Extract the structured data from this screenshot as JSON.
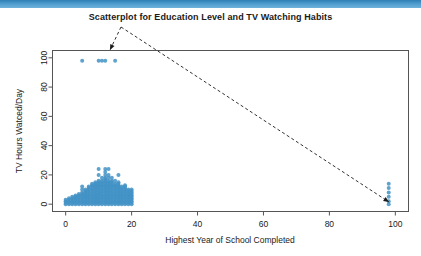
{
  "window": {
    "accent_color": "#3a8cc4"
  },
  "chart_data": {
    "type": "scatter",
    "title": "Scatterplot for Education Level and TV Watching Habits",
    "xlabel": "Highest Year of School Completed",
    "ylabel": "TV Hours Watced/Day",
    "xlim": [
      -4,
      104
    ],
    "ylim": [
      -5,
      105
    ],
    "xticks": [
      0,
      20,
      40,
      60,
      80,
      100
    ],
    "yticks": [
      0,
      20,
      40,
      60,
      80,
      100
    ],
    "grid": false,
    "legend": null,
    "point_color": "#4292c6",
    "point_size": 2,
    "series": [
      {
        "name": "Respondents",
        "points": [
          [
            0,
            0
          ],
          [
            0,
            1
          ],
          [
            0,
            2
          ],
          [
            0,
            3
          ],
          [
            1,
            0
          ],
          [
            1,
            1
          ],
          [
            1,
            2
          ],
          [
            1,
            3
          ],
          [
            1,
            4
          ],
          [
            2,
            0
          ],
          [
            2,
            1
          ],
          [
            2,
            2
          ],
          [
            2,
            3
          ],
          [
            2,
            4
          ],
          [
            2,
            5
          ],
          [
            3,
            0
          ],
          [
            3,
            1
          ],
          [
            3,
            2
          ],
          [
            3,
            3
          ],
          [
            3,
            4
          ],
          [
            3,
            5
          ],
          [
            3,
            6
          ],
          [
            4,
            0
          ],
          [
            4,
            1
          ],
          [
            4,
            2
          ],
          [
            4,
            3
          ],
          [
            4,
            4
          ],
          [
            4,
            5
          ],
          [
            4,
            6
          ],
          [
            4,
            7
          ],
          [
            5,
            0
          ],
          [
            5,
            1
          ],
          [
            5,
            2
          ],
          [
            5,
            3
          ],
          [
            5,
            4
          ],
          [
            5,
            5
          ],
          [
            5,
            6
          ],
          [
            5,
            7
          ],
          [
            5,
            8
          ],
          [
            5,
            10
          ],
          [
            5,
            12
          ],
          [
            6,
            0
          ],
          [
            6,
            1
          ],
          [
            6,
            2
          ],
          [
            6,
            3
          ],
          [
            6,
            4
          ],
          [
            6,
            5
          ],
          [
            6,
            6
          ],
          [
            6,
            7
          ],
          [
            6,
            8
          ],
          [
            6,
            9
          ],
          [
            6,
            10
          ],
          [
            7,
            0
          ],
          [
            7,
            1
          ],
          [
            7,
            2
          ],
          [
            7,
            3
          ],
          [
            7,
            4
          ],
          [
            7,
            5
          ],
          [
            7,
            6
          ],
          [
            7,
            7
          ],
          [
            7,
            8
          ],
          [
            7,
            9
          ],
          [
            7,
            10
          ],
          [
            7,
            11
          ],
          [
            7,
            12
          ],
          [
            8,
            0
          ],
          [
            8,
            1
          ],
          [
            8,
            2
          ],
          [
            8,
            3
          ],
          [
            8,
            4
          ],
          [
            8,
            5
          ],
          [
            8,
            6
          ],
          [
            8,
            7
          ],
          [
            8,
            8
          ],
          [
            8,
            9
          ],
          [
            8,
            10
          ],
          [
            8,
            11
          ],
          [
            8,
            12
          ],
          [
            8,
            13
          ],
          [
            8,
            14
          ],
          [
            9,
            0
          ],
          [
            9,
            1
          ],
          [
            9,
            2
          ],
          [
            9,
            3
          ],
          [
            9,
            4
          ],
          [
            9,
            5
          ],
          [
            9,
            6
          ],
          [
            9,
            7
          ],
          [
            9,
            8
          ],
          [
            9,
            9
          ],
          [
            9,
            10
          ],
          [
            9,
            11
          ],
          [
            9,
            12
          ],
          [
            9,
            13
          ],
          [
            9,
            14
          ],
          [
            9,
            15
          ],
          [
            10,
            0
          ],
          [
            10,
            1
          ],
          [
            10,
            2
          ],
          [
            10,
            3
          ],
          [
            10,
            4
          ],
          [
            10,
            5
          ],
          [
            10,
            6
          ],
          [
            10,
            7
          ],
          [
            10,
            8
          ],
          [
            10,
            9
          ],
          [
            10,
            10
          ],
          [
            10,
            11
          ],
          [
            10,
            12
          ],
          [
            10,
            13
          ],
          [
            10,
            14
          ],
          [
            10,
            15
          ],
          [
            10,
            16
          ],
          [
            10,
            20
          ],
          [
            10,
            24
          ],
          [
            11,
            0
          ],
          [
            11,
            1
          ],
          [
            11,
            2
          ],
          [
            11,
            3
          ],
          [
            11,
            4
          ],
          [
            11,
            5
          ],
          [
            11,
            6
          ],
          [
            11,
            7
          ],
          [
            11,
            8
          ],
          [
            11,
            9
          ],
          [
            11,
            10
          ],
          [
            11,
            11
          ],
          [
            11,
            12
          ],
          [
            11,
            13
          ],
          [
            11,
            14
          ],
          [
            11,
            15
          ],
          [
            11,
            16
          ],
          [
            11,
            18
          ],
          [
            12,
            0
          ],
          [
            12,
            1
          ],
          [
            12,
            2
          ],
          [
            12,
            3
          ],
          [
            12,
            4
          ],
          [
            12,
            5
          ],
          [
            12,
            6
          ],
          [
            12,
            7
          ],
          [
            12,
            8
          ],
          [
            12,
            9
          ],
          [
            12,
            10
          ],
          [
            12,
            11
          ],
          [
            12,
            12
          ],
          [
            12,
            13
          ],
          [
            12,
            14
          ],
          [
            12,
            15
          ],
          [
            12,
            16
          ],
          [
            12,
            17
          ],
          [
            12,
            18
          ],
          [
            12,
            20
          ],
          [
            12,
            22
          ],
          [
            12,
            24
          ],
          [
            13,
            0
          ],
          [
            13,
            1
          ],
          [
            13,
            2
          ],
          [
            13,
            3
          ],
          [
            13,
            4
          ],
          [
            13,
            5
          ],
          [
            13,
            6
          ],
          [
            13,
            7
          ],
          [
            13,
            8
          ],
          [
            13,
            9
          ],
          [
            13,
            10
          ],
          [
            13,
            11
          ],
          [
            13,
            12
          ],
          [
            13,
            13
          ],
          [
            13,
            14
          ],
          [
            13,
            15
          ],
          [
            13,
            16
          ],
          [
            13,
            18
          ],
          [
            13,
            20
          ],
          [
            13,
            24
          ],
          [
            14,
            0
          ],
          [
            14,
            1
          ],
          [
            14,
            2
          ],
          [
            14,
            3
          ],
          [
            14,
            4
          ],
          [
            14,
            5
          ],
          [
            14,
            6
          ],
          [
            14,
            7
          ],
          [
            14,
            8
          ],
          [
            14,
            9
          ],
          [
            14,
            10
          ],
          [
            14,
            11
          ],
          [
            14,
            12
          ],
          [
            14,
            13
          ],
          [
            14,
            14
          ],
          [
            14,
            15
          ],
          [
            14,
            16
          ],
          [
            14,
            18
          ],
          [
            15,
            0
          ],
          [
            15,
            1
          ],
          [
            15,
            2
          ],
          [
            15,
            3
          ],
          [
            15,
            4
          ],
          [
            15,
            5
          ],
          [
            15,
            6
          ],
          [
            15,
            7
          ],
          [
            15,
            8
          ],
          [
            15,
            9
          ],
          [
            15,
            10
          ],
          [
            15,
            11
          ],
          [
            15,
            12
          ],
          [
            15,
            13
          ],
          [
            15,
            14
          ],
          [
            15,
            16
          ],
          [
            16,
            0
          ],
          [
            16,
            1
          ],
          [
            16,
            2
          ],
          [
            16,
            3
          ],
          [
            16,
            4
          ],
          [
            16,
            5
          ],
          [
            16,
            6
          ],
          [
            16,
            7
          ],
          [
            16,
            8
          ],
          [
            16,
            9
          ],
          [
            16,
            10
          ],
          [
            16,
            11
          ],
          [
            16,
            12
          ],
          [
            16,
            13
          ],
          [
            16,
            14
          ],
          [
            16,
            15
          ],
          [
            16,
            20
          ],
          [
            17,
            0
          ],
          [
            17,
            1
          ],
          [
            17,
            2
          ],
          [
            17,
            3
          ],
          [
            17,
            4
          ],
          [
            17,
            5
          ],
          [
            17,
            6
          ],
          [
            17,
            7
          ],
          [
            17,
            8
          ],
          [
            17,
            9
          ],
          [
            17,
            10
          ],
          [
            17,
            11
          ],
          [
            17,
            12
          ],
          [
            18,
            0
          ],
          [
            18,
            1
          ],
          [
            18,
            2
          ],
          [
            18,
            3
          ],
          [
            18,
            4
          ],
          [
            18,
            5
          ],
          [
            18,
            6
          ],
          [
            18,
            7
          ],
          [
            18,
            8
          ],
          [
            18,
            9
          ],
          [
            18,
            10
          ],
          [
            18,
            11
          ],
          [
            18,
            12
          ],
          [
            18,
            13
          ],
          [
            19,
            0
          ],
          [
            19,
            1
          ],
          [
            19,
            2
          ],
          [
            19,
            3
          ],
          [
            19,
            4
          ],
          [
            19,
            5
          ],
          [
            19,
            6
          ],
          [
            19,
            7
          ],
          [
            19,
            8
          ],
          [
            19,
            9
          ],
          [
            19,
            10
          ],
          [
            20,
            0
          ],
          [
            20,
            1
          ],
          [
            20,
            2
          ],
          [
            20,
            3
          ],
          [
            20,
            4
          ],
          [
            20,
            5
          ],
          [
            20,
            6
          ],
          [
            20,
            7
          ],
          [
            20,
            8
          ],
          [
            20,
            9
          ],
          [
            20,
            10
          ],
          [
            5,
            98
          ],
          [
            10,
            98
          ],
          [
            11,
            98
          ],
          [
            12,
            98
          ],
          [
            15,
            98
          ],
          [
            98,
            0
          ],
          [
            98,
            2
          ],
          [
            98,
            5
          ],
          [
            98,
            8
          ],
          [
            98,
            11
          ],
          [
            98,
            14
          ]
        ]
      }
    ],
    "annotations": [
      {
        "name": "missing-value-code-98-y",
        "kind": "arrow",
        "vertex": [
          121,
          27
        ],
        "tip": [
          110,
          50
        ],
        "style": "dashed"
      },
      {
        "name": "missing-value-code-98-x",
        "kind": "arrow",
        "vertex": [
          121,
          27
        ],
        "tip": [
          389,
          202
        ],
        "style": "dashed"
      }
    ]
  }
}
